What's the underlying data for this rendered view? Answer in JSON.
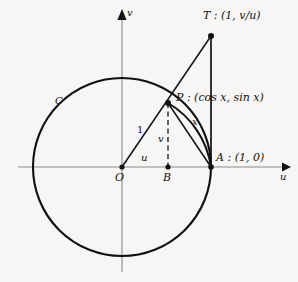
{
  "figure": {
    "background": "#f7f6f4",
    "ink": "#111111",
    "axis_color": "#8a8a8a",
    "width": 298,
    "height": 282
  },
  "axes": {
    "u_label": "u",
    "v_label": "v",
    "origin_label": "O"
  },
  "curve": {
    "circle_label": "C"
  },
  "points": {
    "T": "T : (1, v/u)",
    "P": "P : (cos x, sin x)",
    "A": "A : (1, 0)",
    "B": "B",
    "O": "O"
  },
  "segments": {
    "radius": "1",
    "vertical": "v",
    "horizontal": "u",
    "arc": "x"
  },
  "geometry": {
    "center": [
      122,
      167
    ],
    "radius": 89,
    "point_A": [
      211,
      167
    ],
    "point_B": [
      168,
      167
    ],
    "point_P": [
      168,
      103
    ],
    "point_T": [
      211,
      36
    ],
    "u_axis": [
      18,
      285
    ],
    "v_axis": [
      10,
      272
    ]
  }
}
